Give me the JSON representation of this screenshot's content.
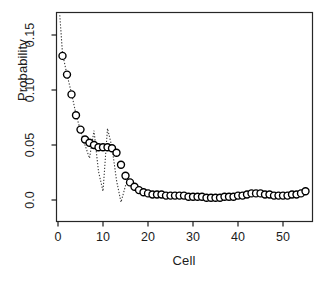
{
  "chart_data": {
    "type": "scatter",
    "title": "",
    "xlabel": "Cell",
    "ylabel": "Probability",
    "xlim": [
      -1.5,
      57
    ],
    "ylim": [
      -0.006,
      0.168
    ],
    "xticks": [
      0,
      10,
      20,
      30,
      40,
      50
    ],
    "xtick_labels": [
      "0",
      "10",
      "20",
      "30",
      "40",
      "50"
    ],
    "yticks": [
      0.0,
      0.05,
      0.1,
      0.15
    ],
    "ytick_labels": [
      "0.0",
      "0.05",
      "0.10",
      "0.15"
    ],
    "grid": false,
    "legend": null,
    "marker": "open-circle",
    "series": [
      {
        "name": "observed",
        "style": "open-circle-markers",
        "x": [
          1,
          2,
          3,
          4,
          5,
          6,
          7,
          8,
          9,
          10,
          11,
          12,
          13,
          14,
          15,
          16,
          17,
          18,
          19,
          20,
          21,
          22,
          23,
          24,
          25,
          26,
          27,
          28,
          29,
          30,
          31,
          32,
          33,
          34,
          35,
          36,
          37,
          38,
          39,
          40,
          41,
          42,
          43,
          44,
          45,
          46,
          47,
          48,
          49,
          50,
          51,
          52,
          53,
          54,
          55
        ],
        "values": [
          0.131,
          0.114,
          0.096,
          0.077,
          0.064,
          0.055,
          0.052,
          0.05,
          0.048,
          0.048,
          0.048,
          0.047,
          0.043,
          0.032,
          0.022,
          0.016,
          0.012,
          0.009,
          0.007,
          0.006,
          0.005,
          0.005,
          0.005,
          0.004,
          0.004,
          0.004,
          0.004,
          0.004,
          0.003,
          0.003,
          0.003,
          0.003,
          0.002,
          0.002,
          0.002,
          0.002,
          0.003,
          0.003,
          0.003,
          0.004,
          0.004,
          0.005,
          0.006,
          0.006,
          0.006,
          0.005,
          0.005,
          0.004,
          0.004,
          0.004,
          0.004,
          0.005,
          0.005,
          0.006,
          0.008
        ]
      },
      {
        "name": "fitted-dotted",
        "style": "dotted-line",
        "x": [
          0.4,
          1,
          2,
          3,
          4,
          5,
          6,
          7,
          8,
          9,
          10,
          11,
          12,
          13,
          14,
          15,
          16,
          17,
          18,
          19,
          20,
          21,
          22,
          23,
          24,
          25,
          26,
          27,
          28,
          29,
          30,
          31,
          32,
          33,
          34,
          35,
          36,
          37,
          38,
          39,
          40,
          41,
          42,
          43,
          44,
          45,
          46,
          47,
          48,
          49,
          50,
          51,
          52,
          53,
          54,
          55
        ],
        "values": [
          0.168,
          0.133,
          0.114,
          0.097,
          0.078,
          0.063,
          0.05,
          0.038,
          0.063,
          0.026,
          0.008,
          0.065,
          0.048,
          0.018,
          -0.002,
          0.013,
          0.015,
          0.012,
          0.009,
          0.007,
          0.006,
          0.005,
          0.005,
          0.004,
          0.004,
          0.004,
          0.004,
          0.004,
          0.003,
          0.003,
          0.003,
          0.003,
          0.002,
          0.002,
          0.002,
          0.002,
          0.003,
          0.003,
          0.003,
          0.004,
          0.004,
          0.005,
          0.006,
          0.006,
          0.006,
          0.005,
          0.005,
          0.004,
          0.004,
          0.004,
          0.004,
          0.005,
          0.005,
          0.006,
          0.008,
          0.009
        ]
      }
    ]
  },
  "axes": {
    "xlabel": "Cell",
    "ylabel": "Probability",
    "xtick_labels": [
      "0",
      "10",
      "20",
      "30",
      "40",
      "50"
    ],
    "ytick_labels": [
      "0.0",
      "0.05",
      "0.10",
      "0.15"
    ]
  },
  "colors": {
    "frame": "#1a1a1a",
    "marker_stroke": "#000000",
    "marker_fill": "#ffffff",
    "line": "#3a3a3a",
    "text": "#1c1c1c",
    "background": "#ffffff"
  }
}
